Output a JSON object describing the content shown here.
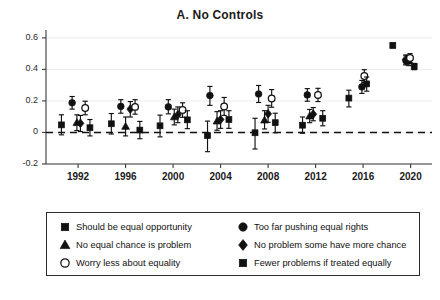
{
  "title": "A. No Controls",
  "axes": {
    "y_ticks": [
      "0.6",
      "0.4",
      "0.2",
      "0",
      "-0.2"
    ],
    "y_tick_values": [
      0.6,
      0.4,
      0.2,
      0,
      -0.2
    ],
    "x_ticks": [
      "1992",
      "1996",
      "2000",
      "2004",
      "2008",
      "2012",
      "2016",
      "2020"
    ],
    "x_tick_values": [
      1992,
      1996,
      2000,
      2004,
      2008,
      2012,
      2016,
      2020
    ],
    "ylim": [
      -0.27,
      0.65
    ],
    "xlim": [
      1989.3,
      2021.8
    ],
    "zero_line": 0,
    "grid": true
  },
  "legend": {
    "items": [
      {
        "label": "Should be equal opportunity",
        "marker": "square",
        "fill": "solid",
        "col": 0,
        "row": 0
      },
      {
        "label": "No equal chance is problem",
        "marker": "triangle",
        "fill": "solid",
        "col": 0,
        "row": 1
      },
      {
        "label": "Worry less about equality",
        "marker": "circle",
        "fill": "open",
        "col": 0,
        "row": 2
      },
      {
        "label": "Too far pushing equal rights",
        "marker": "circle",
        "fill": "solid",
        "col": 1,
        "row": 0
      },
      {
        "label": "No problem some have more chance",
        "marker": "diamond",
        "fill": "solid",
        "col": 1,
        "row": 1
      },
      {
        "label": "Fewer problems if treated equally",
        "marker": "square",
        "fill": "solid",
        "col": 1,
        "row": 2
      }
    ]
  },
  "chart_data": {
    "type": "scatter",
    "title": "A. No Controls",
    "xlabel": "",
    "ylabel": "",
    "ylim": [
      -0.27,
      0.65
    ],
    "grid": true,
    "legend_position": "below",
    "marker_color": "#111111",
    "series": [
      {
        "name": "Should be equal opportunity",
        "marker": "square",
        "fill": "solid",
        "points": [
          {
            "x": 1990.6,
            "y": 0.048,
            "lo": -0.015,
            "hi": 0.112
          },
          {
            "x": 1994.8,
            "y": 0.055,
            "lo": -0.01,
            "hi": 0.12
          },
          {
            "x": 1998.9,
            "y": 0.042,
            "lo": -0.028,
            "hi": 0.11
          },
          {
            "x": 2002.9,
            "y": -0.02,
            "lo": -0.122,
            "hi": 0.072
          },
          {
            "x": 2006.9,
            "y": -0.002,
            "lo": -0.105,
            "hi": 0.09
          },
          {
            "x": 2010.9,
            "y": 0.046,
            "lo": -0.005,
            "hi": 0.098
          },
          {
            "x": 2014.8,
            "y": 0.218,
            "lo": 0.162,
            "hi": 0.268
          }
        ]
      },
      {
        "name": "Too far pushing equal rights",
        "marker": "circle",
        "fill": "solid",
        "points": [
          {
            "x": 1991.5,
            "y": 0.188,
            "lo": 0.148,
            "hi": 0.228
          },
          {
            "x": 1995.6,
            "y": 0.165,
            "lo": 0.122,
            "hi": 0.208
          },
          {
            "x": 1999.6,
            "y": 0.162,
            "lo": 0.118,
            "hi": 0.208
          },
          {
            "x": 2003.1,
            "y": 0.234,
            "lo": 0.172,
            "hi": 0.292
          },
          {
            "x": 2007.2,
            "y": 0.244,
            "lo": 0.19,
            "hi": 0.298
          },
          {
            "x": 2011.3,
            "y": 0.238,
            "lo": 0.198,
            "hi": 0.278
          },
          {
            "x": 2015.9,
            "y": 0.289,
            "lo": 0.248,
            "hi": 0.33
          },
          {
            "x": 2019.6,
            "y": 0.456,
            "lo": 0.428,
            "hi": 0.486
          }
        ]
      },
      {
        "name": "No equal chance is problem",
        "marker": "triangle",
        "fill": "solid",
        "points": [
          {
            "x": 1991.9,
            "y": 0.062,
            "lo": 0.012,
            "hi": 0.112
          },
          {
            "x": 1996.0,
            "y": 0.038,
            "lo": -0.022,
            "hi": 0.098
          },
          {
            "x": 2000.1,
            "y": 0.098,
            "lo": 0.048,
            "hi": 0.148
          },
          {
            "x": 2003.7,
            "y": 0.072,
            "lo": 0.014,
            "hi": 0.132
          },
          {
            "x": 2007.7,
            "y": 0.078,
            "lo": 0.022,
            "hi": 0.138
          },
          {
            "x": 2011.5,
            "y": 0.104,
            "lo": 0.062,
            "hi": 0.146
          },
          {
            "x": 2019.85,
            "y": 0.452,
            "lo": 0.424,
            "hi": 0.482
          }
        ]
      },
      {
        "name": "No problem some have more chance",
        "marker": "diamond",
        "fill": "solid",
        "points": [
          {
            "x": 1992.2,
            "y": 0.058,
            "lo": 0.006,
            "hi": 0.108
          },
          {
            "x": 1996.4,
            "y": 0.148,
            "lo": 0.098,
            "hi": 0.196
          },
          {
            "x": 2000.4,
            "y": 0.112,
            "lo": 0.062,
            "hi": 0.162
          },
          {
            "x": 2004.0,
            "y": 0.082,
            "lo": 0.026,
            "hi": 0.138
          },
          {
            "x": 2008.0,
            "y": 0.118,
            "lo": 0.064,
            "hi": 0.172
          },
          {
            "x": 2011.8,
            "y": 0.116,
            "lo": 0.074,
            "hi": 0.158
          },
          {
            "x": 2019.6,
            "y": 0.462,
            "lo": 0.434,
            "hi": 0.492
          }
        ]
      },
      {
        "name": "Worry less about equality",
        "marker": "circle",
        "fill": "open",
        "points": [
          {
            "x": 1992.6,
            "y": 0.155,
            "lo": 0.112,
            "hi": 0.198
          },
          {
            "x": 1996.8,
            "y": 0.162,
            "lo": 0.116,
            "hi": 0.208
          },
          {
            "x": 2000.8,
            "y": 0.142,
            "lo": 0.096,
            "hi": 0.188
          },
          {
            "x": 2004.3,
            "y": 0.165,
            "lo": 0.108,
            "hi": 0.222
          },
          {
            "x": 2008.3,
            "y": 0.215,
            "lo": 0.16,
            "hi": 0.272
          },
          {
            "x": 2012.2,
            "y": 0.238,
            "lo": 0.196,
            "hi": 0.28
          },
          {
            "x": 2016.1,
            "y": 0.358,
            "lo": 0.318,
            "hi": 0.398
          },
          {
            "x": 2019.95,
            "y": 0.472,
            "lo": 0.444,
            "hi": 0.5
          }
        ]
      },
      {
        "name": "Fewer problems if treated equally",
        "marker": "square",
        "fill": "solid",
        "points": [
          {
            "x": 1993.0,
            "y": 0.03,
            "lo": -0.022,
            "hi": 0.082
          },
          {
            "x": 1997.2,
            "y": 0.015,
            "lo": -0.04,
            "hi": 0.07
          },
          {
            "x": 2001.2,
            "y": 0.08,
            "lo": 0.024,
            "hi": 0.138
          },
          {
            "x": 2004.7,
            "y": 0.082,
            "lo": 0.026,
            "hi": 0.138
          },
          {
            "x": 2008.6,
            "y": 0.062,
            "lo": -0.002,
            "hi": 0.122
          },
          {
            "x": 2012.6,
            "y": 0.09,
            "lo": 0.042,
            "hi": 0.138
          },
          {
            "x": 2016.3,
            "y": 0.308,
            "lo": 0.262,
            "hi": 0.352
          },
          {
            "x": 2018.5,
            "y": 0.552,
            "lo": 0.538,
            "hi": 0.566
          },
          {
            "x": 2020.3,
            "y": 0.418,
            "lo": 0.398,
            "hi": 0.438
          }
        ]
      }
    ]
  }
}
